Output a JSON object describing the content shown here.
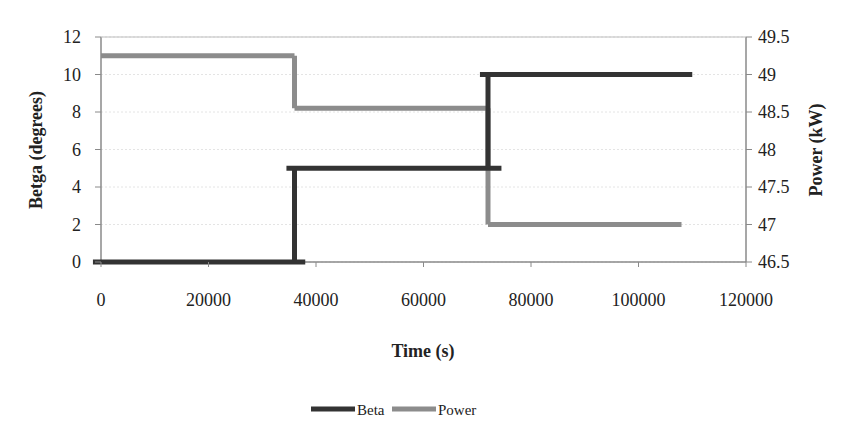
{
  "chart_data": {
    "type": "line",
    "title": "",
    "xlabel": "Time (s)",
    "ylabel": "Betga (degrees)",
    "y2label": "Power (kW)",
    "xlim": [
      0,
      120000
    ],
    "ylim": [
      0,
      12
    ],
    "y2lim": [
      46.5,
      49.5
    ],
    "x_ticks": [
      "0",
      "20000",
      "40000",
      "60000",
      "80000",
      "100000",
      "120000"
    ],
    "y_ticks": [
      "0",
      "2",
      "4",
      "6",
      "8",
      "10",
      "12"
    ],
    "y2_ticks": [
      "46.5",
      "47",
      "47.5",
      "48",
      "48.5",
      "49",
      "49.5"
    ],
    "grid": true,
    "legend_position": "bottom",
    "series": [
      {
        "name": "Beta",
        "axis": "left",
        "color": "#333333",
        "step": true,
        "x": [
          -1500,
          36000,
          36000,
          72000,
          72000,
          110000
        ],
        "values": [
          0,
          0,
          5,
          5,
          10,
          10
        ],
        "segments": [
          {
            "x_start": -1500,
            "x_end": 38000,
            "value": 0
          },
          {
            "x_start": 34500,
            "x_end": 74500,
            "value": 5
          },
          {
            "x_start": 70500,
            "x_end": 110000,
            "value": 10
          }
        ]
      },
      {
        "name": "Power",
        "axis": "right",
        "color": "#8c8c8c",
        "step": true,
        "x": [
          0,
          36000,
          36000,
          72000,
          72000,
          108000
        ],
        "values": [
          49.25,
          49.25,
          48.55,
          48.55,
          47.0,
          47.0
        ],
        "segments": [
          {
            "x_start": 0,
            "x_end": 36000,
            "value": 49.25
          },
          {
            "x_start": 36000,
            "x_end": 72000,
            "value": 48.55
          },
          {
            "x_start": 72000,
            "x_end": 108000,
            "value": 47.0
          }
        ]
      }
    ]
  },
  "legend": {
    "items": [
      {
        "label": "Beta",
        "color": "#333333"
      },
      {
        "label": "Power",
        "color": "#8c8c8c"
      }
    ]
  }
}
